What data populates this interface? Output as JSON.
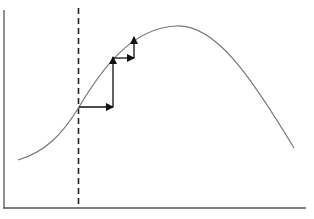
{
  "diagram": {
    "type": "hill-climbing curve with step arrows",
    "colors": {
      "background": "#ffffff",
      "axis": "#555555",
      "curve": "#777777",
      "dashed_line": "#222222",
      "arrows": "#111111"
    },
    "axes": {
      "y_axis": {
        "x": 4,
        "y1": 10,
        "y2": 208
      },
      "x_axis": {
        "y": 208,
        "x1": 3,
        "x2": 306
      }
    },
    "dashed_line": {
      "x": 78.5,
      "y1": 8,
      "y2": 208
    },
    "curve": {
      "path": "M18,160 C45,152 62,135 79,107 C100,72 130,28 176,26 C215,24 250,75 294,148"
    },
    "arrows": [
      {
        "from": [
          79,
          107
        ],
        "to": [
          113,
          107
        ],
        "direction": "right"
      },
      {
        "from": [
          113,
          107
        ],
        "to": [
          113,
          57
        ],
        "direction": "up"
      },
      {
        "from": [
          113,
          58
        ],
        "to": [
          134,
          58
        ],
        "direction": "right"
      },
      {
        "from": [
          134,
          58
        ],
        "to": [
          134,
          37
        ],
        "direction": "up"
      }
    ]
  }
}
